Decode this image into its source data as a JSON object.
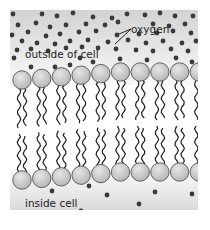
{
  "diagram": {
    "labels": {
      "oxygen": "oxygen",
      "outside": "outside of cell",
      "inside": "inside cell"
    },
    "colors": {
      "outside_bg_top": "#d2d2d2",
      "outside_bg_bottom": "#fafafa",
      "inside_bg_top": "#fbfbfb",
      "inside_bg_bottom": "#dadada",
      "molecule": "#3a3a3a",
      "head_fill": "#c4c4c4",
      "head_stroke": "#555555",
      "tail": "#1e1e1e"
    },
    "counts": {
      "phospholipids_per_layer": 10,
      "oxygen_outside": 60,
      "oxygen_inside": 12
    }
  }
}
